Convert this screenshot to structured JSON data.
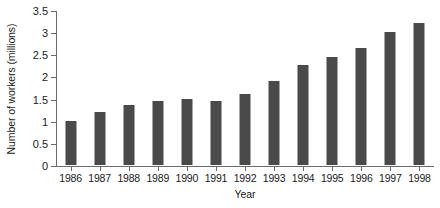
{
  "chart_data": {
    "type": "bar",
    "title": "",
    "xlabel": "Year",
    "ylabel": "Number of workers (millions)",
    "categories": [
      "1986",
      "1987",
      "1988",
      "1989",
      "1990",
      "1991",
      "1992",
      "1993",
      "1994",
      "1995",
      "1996",
      "1997",
      "1998"
    ],
    "values": [
      1.0,
      1.2,
      1.35,
      1.45,
      1.5,
      1.45,
      1.6,
      1.9,
      2.25,
      2.45,
      2.65,
      3.0,
      3.2
    ],
    "series": [
      {
        "name": "Number of workers",
        "values": [
          1.0,
          1.2,
          1.35,
          1.45,
          1.5,
          1.45,
          1.6,
          1.9,
          2.25,
          2.45,
          2.65,
          3.0,
          3.2
        ]
      }
    ],
    "ylim": [
      0,
      3.5
    ],
    "ytick_values": [
      0,
      0.5,
      1,
      1.5,
      2,
      2.5,
      3,
      3.5
    ],
    "ytick_labels": [
      "0",
      "0.5",
      "1",
      "1.5",
      "2",
      "2.5",
      "3",
      "3.5"
    ],
    "grid": false,
    "legend": "none",
    "bar_color": "#4a4a4a",
    "axis_color": "#6b6b6b"
  }
}
